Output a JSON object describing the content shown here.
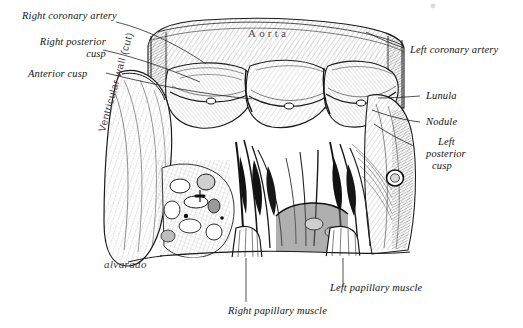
{
  "figure": {
    "medium": "pen-and-ink line engraving",
    "background_color": "#ffffff",
    "ink_color": "#1a1a1a",
    "signature": "alvarado",
    "embedded_text": {
      "aorta": "Aorta",
      "ventricular_wall": "Ventricular wall (cut)"
    }
  },
  "labels": {
    "right_coronary_artery": "Right coronary artery",
    "right_posterior_cusp_l1": "Right posterior",
    "right_posterior_cusp_l2": "cusp",
    "anterior_cusp": "Anterior cusp",
    "left_coronary_artery": "Left coronary artery",
    "lunula": "Lunula",
    "nodule": "Nodule",
    "left_posterior_cusp_l1": "Left",
    "left_posterior_cusp_l2": "posterior",
    "left_posterior_cusp_l3": "cusp",
    "right_papillary_muscle": "Right papillary muscle",
    "left_papillary_muscle": "Left papillary muscle"
  }
}
